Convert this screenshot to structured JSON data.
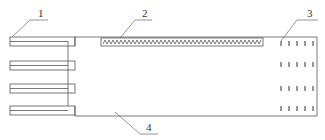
{
  "diagram": {
    "type": "technical-schematic",
    "labels": [
      {
        "id": "1",
        "text": "1",
        "target": "connector-tabs"
      },
      {
        "id": "2",
        "text": "2",
        "target": "serpentine-heater"
      },
      {
        "id": "3",
        "text": "3",
        "target": "tick-array"
      },
      {
        "id": "4",
        "text": "4",
        "target": "substrate-body"
      }
    ],
    "tab_count": 4,
    "tick_rows": 4,
    "ticks_per_row": 5,
    "line_color": "#555555"
  }
}
